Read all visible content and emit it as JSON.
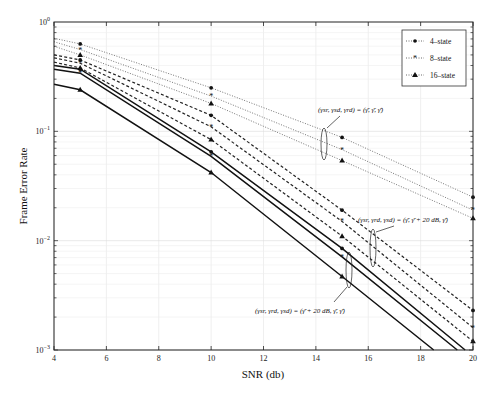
{
  "chart_data": {
    "type": "line",
    "title": "",
    "xlabel": "SNR (db)",
    "ylabel": "Frame Error Rate",
    "xlim": [
      4,
      20
    ],
    "ylim": [
      0.001,
      1
    ],
    "yscale": "log",
    "grid": true,
    "legend_position": "upper right",
    "x_ticks": [
      4,
      6,
      8,
      10,
      12,
      14,
      16,
      18,
      20
    ],
    "y_ticks": [
      "10^0",
      "10^-1",
      "10^-2",
      "10^-3"
    ],
    "legend": [
      {
        "label": "4-state",
        "marker": "circle"
      },
      {
        "label": "8-state",
        "marker": "star"
      },
      {
        "label": "16-state",
        "marker": "triangle"
      }
    ],
    "series": [
      {
        "name": "4-state (γ̄, γ̄, γ̄)",
        "group": "equal",
        "style": "dotted",
        "marker": "circle",
        "x": [
          4,
          5,
          10,
          15,
          20
        ],
        "values": [
          0.71,
          0.63,
          0.25,
          0.088,
          0.025
        ]
      },
      {
        "name": "8-state (γ̄, γ̄, γ̄)",
        "group": "equal",
        "style": "dotted",
        "marker": "star",
        "x": [
          4,
          5,
          10,
          15,
          20
        ],
        "values": [
          0.66,
          0.56,
          0.21,
          0.068,
          0.019
        ]
      },
      {
        "name": "16-state (γ̄, γ̄, γ̄)",
        "group": "equal",
        "style": "dotted",
        "marker": "triangle",
        "x": [
          4,
          5,
          10,
          15,
          20
        ],
        "values": [
          0.6,
          0.5,
          0.18,
          0.054,
          0.016
        ]
      },
      {
        "name": "4-state (γ̄, γ̄+20 dB, γ̄)",
        "group": "rd_plus20",
        "style": "dashed",
        "marker": "circle",
        "x": [
          4,
          5,
          10,
          15,
          20
        ],
        "values": [
          0.5,
          0.45,
          0.14,
          0.019,
          0.0023
        ]
      },
      {
        "name": "8-state (γ̄, γ̄+20 dB, γ̄)",
        "group": "rd_plus20",
        "style": "dashed",
        "marker": "star",
        "x": [
          4,
          5,
          10,
          15,
          20
        ],
        "values": [
          0.47,
          0.42,
          0.11,
          0.015,
          0.0016
        ]
      },
      {
        "name": "16-state (γ̄, γ̄+20 dB, γ̄)",
        "group": "rd_plus20",
        "style": "dashed",
        "marker": "triangle",
        "x": [
          4,
          5,
          10,
          15,
          20
        ],
        "values": [
          0.43,
          0.38,
          0.084,
          0.011,
          0.0012
        ]
      },
      {
        "name": "4-state (γ̄+20 dB, γ̄, γ̄)",
        "group": "sr_plus20",
        "style": "solid",
        "marker": "circle",
        "x": [
          4,
          5,
          10,
          15,
          19.7
        ],
        "values": [
          0.4,
          0.37,
          0.065,
          0.0085,
          0.001
        ]
      },
      {
        "name": "8-state (γ̄+20 dB, γ̄, γ̄)",
        "group": "sr_plus20",
        "style": "solid",
        "marker": "star",
        "x": [
          4,
          5,
          10,
          15,
          19.4
        ],
        "values": [
          0.37,
          0.34,
          0.059,
          0.0071,
          0.001
        ]
      },
      {
        "name": "16-state (γ̄+20 dB, γ̄, γ̄)",
        "group": "sr_plus20",
        "style": "solid",
        "marker": "triangle",
        "x": [
          4,
          5,
          10,
          15,
          18.5
        ],
        "values": [
          0.27,
          0.24,
          0.042,
          0.0047,
          0.001
        ]
      }
    ],
    "annotations": [
      {
        "text": "(γsr, γsd, γrd) = (γ̄, γ̄, γ̄)",
        "target_group": "equal"
      },
      {
        "text": "(γsr, γrd, γsd) = (γ̄, γ̄ + 20 dB, γ̄)",
        "target_group": "rd_plus20"
      },
      {
        "text": "(γsr, γrd, γsd) = (γ̄ + 20 dB, γ̄, γ̄)",
        "target_group": "sr_plus20"
      }
    ]
  },
  "labels": {
    "xlabel": "SNR (db)",
    "ylabel": "Frame Error Rate",
    "legend_4": "4–state",
    "legend_8": "8–state",
    "legend_16": "16–state",
    "annot_equal": "(γsr, γsd, γrd) = (γ̄, γ̄, γ̄)",
    "annot_rd": "(γsr, γrd, γsd) = (γ̄, γ̄ + 20 dB, γ̄)",
    "annot_sr": "(γsr, γrd, γsd) = (γ̄ + 20 dB, γ̄, γ̄)"
  }
}
